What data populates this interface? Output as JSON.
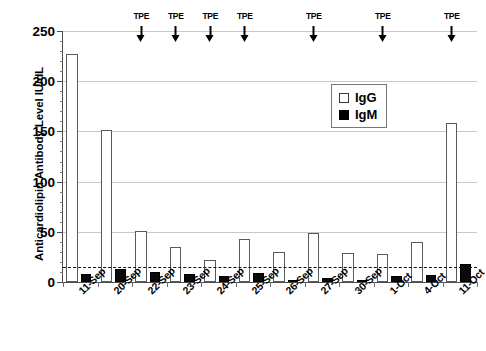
{
  "chart_data": {
    "type": "bar",
    "title": "",
    "xlabel": "",
    "ylabel": "Anticardiolipin Antibody Level IU/dL",
    "ylim": [
      0,
      250
    ],
    "ytick_values": [
      0,
      50,
      100,
      150,
      200,
      250
    ],
    "ytick_labels": [
      "0",
      "50",
      "100",
      "150",
      "200",
      "250"
    ],
    "yminor_step": 10,
    "grid": "horizontal",
    "legend_position": "upper right",
    "categories": [
      "11-Sep",
      "20-Sep",
      "22-Sep",
      "23-Sep",
      "24-Sep",
      "25-Sep",
      "26-Sep",
      "27-Sep",
      "30-Sep",
      "1-Oct",
      "4-Oct",
      "11-Oct"
    ],
    "series": [
      {
        "name": "IgG",
        "style": "open-square",
        "values": [
          227,
          151,
          51,
          35,
          22,
          43,
          30,
          49,
          29,
          28,
          40,
          158
        ]
      },
      {
        "name": "IgM",
        "style": "filled-square",
        "values": [
          8,
          13,
          10,
          8,
          6,
          9,
          2,
          4,
          2,
          6,
          7,
          18
        ]
      }
    ],
    "annotations": {
      "threshold_line": {
        "value": 15,
        "style": "dashed",
        "label": ""
      },
      "events": [
        {
          "label": "TPE",
          "category": "22-Sep"
        },
        {
          "label": "TPE",
          "category": "23-Sep"
        },
        {
          "label": "TPE",
          "category": "24-Sep"
        },
        {
          "label": "TPE",
          "category": "25-Sep"
        },
        {
          "label": "TPE",
          "category": "27-Sep"
        },
        {
          "label": "TPE",
          "category": "1-Oct"
        },
        {
          "label": "TPE",
          "category": "11-Oct"
        }
      ]
    }
  },
  "legend": {
    "items": [
      {
        "label": "IgG",
        "swatch": "open-square"
      },
      {
        "label": "IgM",
        "swatch": "filled-square"
      }
    ]
  }
}
